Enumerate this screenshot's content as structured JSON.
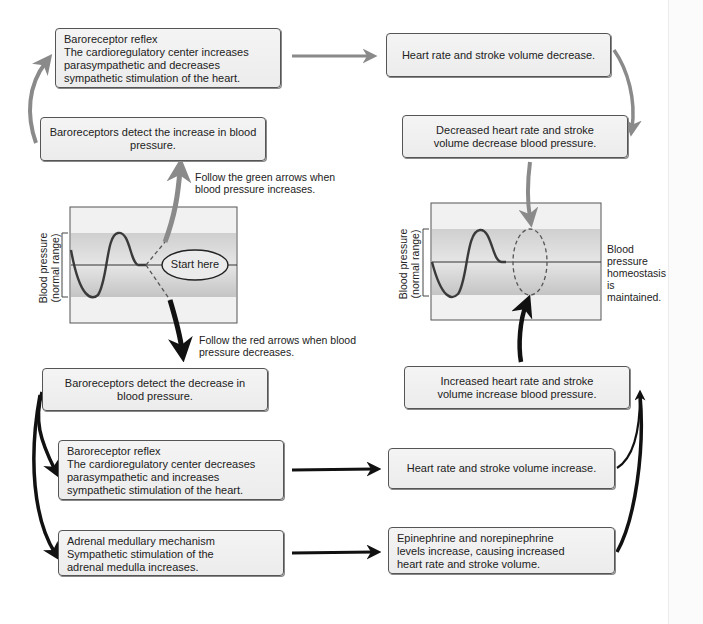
{
  "colors": {
    "increase_arrow": "#8a8a8a",
    "decrease_arrow": "#111111",
    "box_fill": "#efefef",
    "box_border": "#555555",
    "band_fill": "#c9c9c9",
    "graph_bg": "#ececec",
    "wave": "#3a3a3a"
  },
  "increase_path": {
    "detect_box": "Baroreceptors detect the increase in blood pressure.",
    "reflex_box": {
      "title": "Baroreceptor reflex",
      "body": "The cardioregulatory center increases parasympathetic and decreases sympathetic stimulation of the heart."
    },
    "effect_box": "Heart rate and stroke volume decrease.",
    "result_box": "Decreased heart rate and stroke volume decrease blood pressure.",
    "note": "Follow the green arrows when blood pressure increases."
  },
  "decrease_path": {
    "detect_box": "Baroreceptors detect the decrease in blood pressure.",
    "reflex_box": {
      "title": "Baroreceptor reflex",
      "body": "The cardioregulatory center decreases parasympathetic and increases sympathetic stimulation of the heart."
    },
    "adrenal_box": {
      "title": "Adrenal medullary mechanism",
      "body": "Sympathetic stimulation of the adrenal medulla increases."
    },
    "effect_box": "Heart rate and stroke volume increase.",
    "epinephrine_box": "Epinephrine and norepinephrine levels increase, causing increased heart rate and stroke volume.",
    "result_box": "Increased heart rate and stroke volume increase blood pressure.",
    "note": "Follow the red arrows when blood pressure decreases."
  },
  "left_graph": {
    "ylabel_line1": "Blood pressure",
    "ylabel_line2": "(normal range)",
    "start_label": "Start here"
  },
  "right_graph": {
    "ylabel_line1": "Blood pressure",
    "ylabel_line2": "(normal range)",
    "homeostasis_note": "Blood pressure homeostasis is maintained."
  }
}
